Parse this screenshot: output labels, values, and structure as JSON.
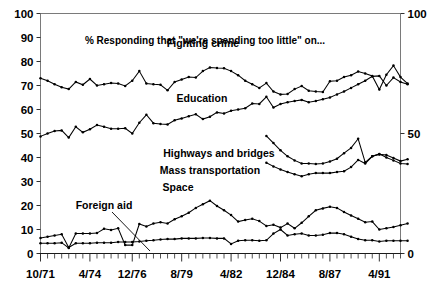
{
  "chart_data": {
    "type": "line",
    "title": "% Responding that \"we're spending too little\" on...",
    "xlabel": "",
    "ylabel": "",
    "ylim": [
      0,
      100
    ],
    "grid": false,
    "legend_position": "inline-annotations",
    "y_ticks_left": [
      "0",
      "10",
      "20",
      "30",
      "40",
      "50",
      "60",
      "70",
      "80",
      "90",
      "100"
    ],
    "y_ticks_right": [
      "0",
      "50",
      "100"
    ],
    "x_tick_labels": [
      "10/71",
      "4/74",
      "12/76",
      "8/79",
      "4/82",
      "12/84",
      "8/87",
      "4/91"
    ],
    "x_tick_index": [
      0,
      7,
      13,
      20,
      27,
      34,
      41,
      48
    ],
    "n_points": 52,
    "annotations": [
      {
        "text": "Fighting crime",
        "x_px": 203,
        "y_px": 47
      },
      {
        "text": "Education",
        "x_px": 202,
        "y_px": 102
      },
      {
        "text": "Highways and bridges",
        "x_px": 219,
        "y_px": 157
      },
      {
        "text": "Mass transportation",
        "x_px": 210,
        "y_px": 174
      },
      {
        "text": "Space",
        "x_px": 178,
        "y_px": 191
      },
      {
        "text": "Foreign aid",
        "x_px": 104,
        "y_px": 209
      }
    ],
    "series": [
      {
        "name": "Fighting crime",
        "start_index": 0,
        "values": [
          73,
          72,
          70.5,
          69.3,
          68.5,
          71.5,
          70.3,
          72.7,
          70,
          70.5,
          71,
          70.8,
          69.8,
          72,
          76,
          70.8,
          70.5,
          70.3,
          68,
          71.5,
          72.5,
          73.5,
          73.3,
          76,
          77.5,
          77.3,
          77.2,
          76,
          74.3,
          72,
          70.5,
          69,
          71,
          67.5,
          66.3,
          66.5,
          68.5,
          69.8,
          67.8,
          67.5,
          67.3,
          71.8,
          72,
          73.5,
          74.3,
          75.8,
          75,
          74,
          68.3,
          74.5,
          78.3,
          73.5,
          70.8
        ]
      },
      {
        "name": "Education",
        "start_index": 0,
        "values": [
          48.8,
          50,
          51,
          51.3,
          48.3,
          52.8,
          50.5,
          51.8,
          53.5,
          52.8,
          52,
          52,
          52.2,
          50,
          54.5,
          57.8,
          54.3,
          54,
          53.8,
          55.5,
          56.3,
          57.2,
          58,
          56,
          57,
          58.8,
          58.3,
          59.5,
          60,
          60.5,
          62.5,
          62.3,
          65.3,
          60.8,
          62.3,
          63,
          63.5,
          64,
          63,
          63.5,
          64.3,
          65,
          66.3,
          67.5,
          69,
          70.5,
          72,
          73.8,
          74,
          70,
          73.3,
          71.5,
          70.5
        ]
      },
      {
        "name": "Highways and bridges",
        "start_index": 32,
        "values": [
          49,
          46,
          43,
          40.5,
          38.8,
          37.5,
          37.5,
          37.3,
          37.5,
          38.3,
          39.5,
          41.8,
          44,
          47.8,
          38,
          40.5,
          41.3,
          41,
          39.8,
          38.5,
          39.3
        ]
      },
      {
        "name": "Mass transportation",
        "start_index": 32,
        "values": [
          37.8,
          36.3,
          35,
          34,
          33,
          32.2,
          33,
          33.5,
          33.5,
          33.5,
          34,
          34.3,
          36,
          39,
          37.5,
          40.5,
          41.5,
          40,
          38.8,
          37.5,
          37.3
        ]
      },
      {
        "name": "Space",
        "start_index": 0,
        "values": [
          6.5,
          7,
          7.5,
          8,
          2.5,
          4.3,
          4.3,
          4.3,
          4.5,
          4.5,
          4.5,
          4.8,
          4.8,
          4.8,
          5,
          5.3,
          5.5,
          5.8,
          6,
          6,
          6.3,
          6.3,
          6.3,
          6.5,
          6.5,
          6.3,
          6.3,
          4,
          5.3,
          5.5,
          5.5,
          5.3,
          5.5,
          8.3,
          10,
          7.5,
          8,
          8.3,
          7.5,
          7.5,
          7.8,
          8.5,
          8.5,
          8,
          7,
          6,
          5.5,
          5.5,
          5,
          5.3,
          5.3,
          5.3,
          5.3
        ]
      },
      {
        "name": "Foreign aid",
        "start_index": 0,
        "values": [
          4.3,
          4.3,
          4.3,
          4.5,
          2.3,
          8.3,
          8.3,
          8.3,
          8.5,
          10.3,
          9.8,
          10.5,
          3.5,
          3.5,
          12.3,
          11.3,
          12.5,
          13,
          12.5,
          14.3,
          15.5,
          17,
          19,
          20.5,
          22,
          19.8,
          18,
          16,
          13.3,
          14,
          14.5,
          13.5,
          11.5,
          12,
          10.8,
          12.5,
          10.5,
          12.8,
          15.5,
          18,
          18.8,
          19.5,
          19,
          17.3,
          15.8,
          14.5,
          13,
          13.3,
          10,
          10.5,
          11,
          11.8,
          12.5
        ]
      }
    ]
  },
  "axes": {
    "left_axis_name": "percent-axis-left",
    "right_axis_name": "percent-axis-right"
  }
}
